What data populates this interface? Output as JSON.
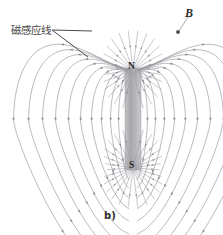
{
  "figure": {
    "caption": "b)",
    "labels": {
      "field_lines": "磁感应线",
      "b_vector": "B",
      "pole_north": "N",
      "pole_south": "S"
    },
    "colors": {
      "background": "#ffffff",
      "field_line": "#9a9aa2",
      "field_line_dark": "#7e7e88",
      "magnet_body": "#b9b9bd",
      "magnet_edge": "#8e8e94",
      "leader": "#4a4a4a",
      "text": "#333333",
      "point_marker": "#3d3d3d"
    }
  },
  "chart_data": {
    "type": "line",
    "title": "",
    "subtitle": "",
    "xlabel": "",
    "ylabel": "",
    "grid": false,
    "legend_position": "none",
    "annotations": [
      {
        "text": "磁感应线",
        "x": 11,
        "y": 30,
        "kind": "leader-label"
      },
      {
        "text": "B",
        "x": 190,
        "y": 13,
        "kind": "vector-label"
      },
      {
        "text": "N",
        "x": 133,
        "y": 66,
        "kind": "pole-label"
      },
      {
        "text": "S",
        "x": 133,
        "y": 165,
        "kind": "pole-label"
      },
      {
        "text": "b)",
        "x": 111,
        "y": 216,
        "kind": "caption"
      }
    ],
    "magnet": {
      "x_center": 133,
      "half_width": 8,
      "north_pole_y": 70,
      "south_pole_y": 168,
      "north_label": "N",
      "south_label": "S"
    },
    "point_marker": {
      "x": 178,
      "y": 32,
      "label": "B"
    },
    "leader_lines": [
      {
        "x1": 52,
        "y1": 30,
        "x2": 92,
        "y2": 31
      },
      {
        "x1": 52,
        "y1": 30,
        "x2": 88,
        "y2": 57
      }
    ],
    "field_line_spreads": [
      10,
      18,
      27,
      37,
      48,
      60,
      73,
      86,
      100,
      115
    ],
    "arrow_direction": "out-of-north-into-south",
    "series": [
      {
        "name": "field-loop-1",
        "spread": 10
      },
      {
        "name": "field-loop-2",
        "spread": 18
      },
      {
        "name": "field-loop-3",
        "spread": 27
      },
      {
        "name": "field-loop-4",
        "spread": 37
      },
      {
        "name": "field-loop-5",
        "spread": 48
      },
      {
        "name": "field-loop-6",
        "spread": 60
      },
      {
        "name": "field-loop-7",
        "spread": 73
      },
      {
        "name": "field-loop-8",
        "spread": 86
      },
      {
        "name": "field-loop-9",
        "spread": 100
      },
      {
        "name": "field-loop-10",
        "spread": 115
      }
    ]
  }
}
